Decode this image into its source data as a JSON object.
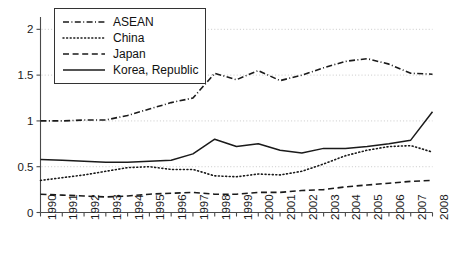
{
  "chart_data": {
    "type": "line",
    "title": "",
    "subtitle": "",
    "xlabel": "",
    "ylabel": "",
    "x": [
      1990,
      1991,
      1992,
      1993,
      1994,
      1995,
      1996,
      1997,
      1998,
      1999,
      2000,
      2001,
      2002,
      2003,
      2004,
      2005,
      2006,
      2007,
      2008
    ],
    "xtick_labels": [
      "1990",
      "1991",
      "1992",
      "1993",
      "1994",
      "1995",
      "1996",
      "1997",
      "1998",
      "1999",
      "2000",
      "2001",
      "2002",
      "2003",
      "2004",
      "2005",
      "2006",
      "2007",
      "2008"
    ],
    "ytick_labels": [
      "0",
      "0.5",
      "1",
      "1.5",
      "2"
    ],
    "yticks": [
      0,
      0.5,
      1,
      1.5,
      2
    ],
    "xlim": [
      1990,
      2008
    ],
    "ylim": [
      0,
      2.08
    ],
    "grid": "horizontal-dotted",
    "legend_position": "top-left-inside",
    "series": [
      {
        "name": "ASEAN",
        "style": "dashdot",
        "color": "#1a1a1a",
        "values": [
          1.0,
          1.0,
          1.01,
          1.01,
          1.06,
          1.13,
          1.2,
          1.25,
          1.52,
          1.45,
          1.55,
          1.44,
          1.5,
          1.58,
          1.65,
          1.68,
          1.62,
          1.52,
          1.51
        ]
      },
      {
        "name": "China",
        "style": "dotted",
        "color": "#1a1a1a",
        "values": [
          0.35,
          0.38,
          0.41,
          0.45,
          0.49,
          0.5,
          0.47,
          0.47,
          0.4,
          0.39,
          0.42,
          0.41,
          0.45,
          0.53,
          0.62,
          0.68,
          0.72,
          0.73,
          0.66
        ]
      },
      {
        "name": "Japan",
        "style": "dashed",
        "color": "#1a1a1a",
        "values": [
          0.2,
          0.19,
          0.18,
          0.17,
          0.18,
          0.2,
          0.21,
          0.22,
          0.2,
          0.2,
          0.22,
          0.22,
          0.24,
          0.25,
          0.28,
          0.3,
          0.32,
          0.34,
          0.35
        ]
      },
      {
        "name": "Korea, Republic",
        "style": "solid",
        "color": "#1a1a1a",
        "values": [
          0.58,
          0.57,
          0.56,
          0.55,
          0.55,
          0.56,
          0.57,
          0.64,
          0.8,
          0.72,
          0.75,
          0.68,
          0.65,
          0.7,
          0.7,
          0.72,
          0.75,
          0.79,
          1.1
        ]
      }
    ]
  },
  "legend": {
    "items": [
      {
        "label": "ASEAN",
        "style": "dashdot"
      },
      {
        "label": "China",
        "style": "dotted"
      },
      {
        "label": "Japan",
        "style": "dashed"
      },
      {
        "label": "Korea, Republic",
        "style": "solid"
      }
    ]
  }
}
